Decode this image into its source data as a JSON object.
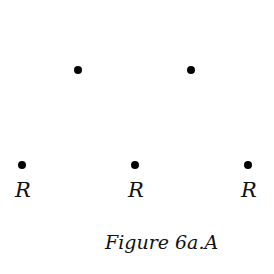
{
  "figure": {
    "caption": "Figure 6a.A",
    "points": [
      {
        "x": 78,
        "y": 70,
        "label": ""
      },
      {
        "x": 191,
        "y": 70,
        "label": ""
      },
      {
        "x": 22,
        "y": 165,
        "label": "R"
      },
      {
        "x": 135,
        "y": 165,
        "label": "R"
      },
      {
        "x": 248,
        "y": 165,
        "label": "R"
      }
    ]
  }
}
